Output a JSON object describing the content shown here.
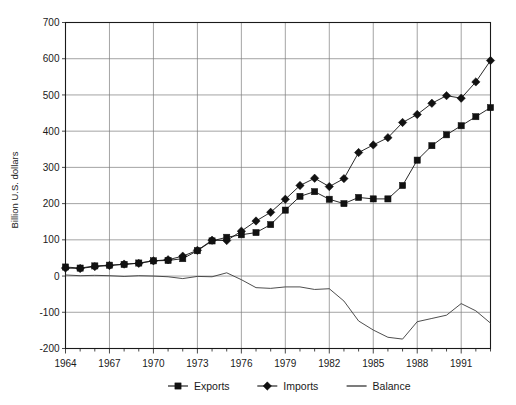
{
  "chart_data": {
    "type": "line",
    "title": "",
    "xlabel": "",
    "ylabel": "Billion U.S. dollars",
    "ylim": [
      -200,
      700
    ],
    "ytick_values": [
      -200,
      -100,
      0,
      100,
      200,
      300,
      400,
      500,
      600,
      700
    ],
    "ytick_labels": [
      "-200",
      "-100",
      "0",
      "100",
      "200",
      "300",
      "400",
      "500",
      "600",
      "700"
    ],
    "xlim": [
      1964,
      1993
    ],
    "x": [
      1964,
      1965,
      1966,
      1967,
      1968,
      1969,
      1970,
      1971,
      1972,
      1973,
      1974,
      1975,
      1976,
      1977,
      1978,
      1979,
      1980,
      1981,
      1982,
      1983,
      1984,
      1985,
      1986,
      1987,
      1988,
      1989,
      1990,
      1991,
      1992,
      1993
    ],
    "xtick_values": [
      1964,
      1965,
      1966,
      1967,
      1968,
      1969,
      1970,
      1971,
      1972,
      1973,
      1974,
      1975,
      1976,
      1977,
      1978,
      1979,
      1980,
      1981,
      1982,
      1983,
      1984,
      1985,
      1986,
      1987,
      1988,
      1989,
      1990,
      1991,
      1992,
      1993
    ],
    "xtick_labels_shown": [
      "1964",
      "1967",
      "1970",
      "1973",
      "1976",
      "1979",
      "1982",
      "1985",
      "1988",
      "1991"
    ],
    "xtick_labeled_values": [
      1964,
      1967,
      1970,
      1973,
      1976,
      1979,
      1982,
      1985,
      1988,
      1991
    ],
    "grid": true,
    "legend_position": "bottom",
    "series": [
      {
        "name": "Exports",
        "marker": "square",
        "color": "#111111",
        "values": [
          25,
          22,
          28,
          30,
          32,
          36,
          42,
          43,
          48,
          70,
          97,
          107,
          114,
          120,
          142,
          182,
          220,
          233,
          212,
          200,
          217,
          213,
          213,
          250,
          320,
          360,
          390,
          415,
          440,
          465
        ]
      },
      {
        "name": "Imports",
        "marker": "diamond",
        "color": "#111111",
        "values": [
          22,
          21,
          26,
          29,
          33,
          35,
          42,
          45,
          55,
          71,
          99,
          98,
          124,
          152,
          176,
          212,
          250,
          270,
          247,
          269,
          341,
          362,
          382,
          424,
          446,
          477,
          498,
          491,
          536,
          595
        ]
      },
      {
        "name": "Balance",
        "marker": "none",
        "color": "#3a3a3a",
        "values": [
          3,
          1,
          2,
          1,
          -1,
          1,
          0,
          -2,
          -7,
          -1,
          -2,
          9,
          -10,
          -32,
          -34,
          -30,
          -30,
          -37,
          -35,
          -69,
          -124,
          -149,
          -169,
          -174,
          -126,
          -117,
          -108,
          -76,
          -96,
          -130
        ]
      }
    ],
    "legend": [
      {
        "label": "Exports",
        "marker": "square"
      },
      {
        "label": "Imports",
        "marker": "diamond"
      },
      {
        "label": "Balance",
        "marker": "line"
      }
    ]
  }
}
